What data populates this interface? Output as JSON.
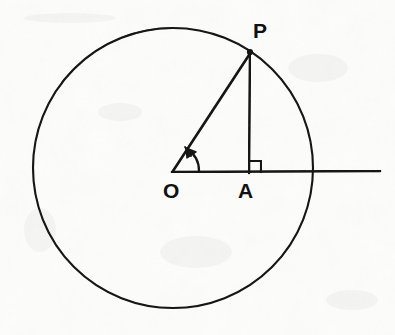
{
  "figure": {
    "kind": "geometry-diagram",
    "background_color": "#fcfcfa",
    "ink_color": "#111111",
    "labels": {
      "center_point": "O",
      "foot_point": "A",
      "circle_point": "P"
    },
    "geometry": {
      "circle": {
        "cx": 173,
        "cy": 168,
        "r": 140
      },
      "points": {
        "O": {
          "x": 173,
          "y": 172
        },
        "A": {
          "x": 249,
          "y": 172
        },
        "P": {
          "x": 251,
          "y": 51
        }
      },
      "segments": [
        {
          "name": "radius-OP",
          "from": "O",
          "to": "P"
        },
        {
          "name": "perpendicular-PA",
          "from": "P",
          "to": "A"
        },
        {
          "name": "horizontal-ray-from-O",
          "from": "O",
          "to_x": 380,
          "to_y": 172
        }
      ],
      "angle_arc": {
        "at": "O",
        "radius": 26,
        "has_arrowhead": true
      },
      "right_angle_marker": {
        "at": "A",
        "size": 11
      }
    }
  }
}
